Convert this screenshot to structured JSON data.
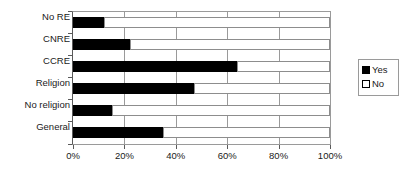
{
  "chart_data": {
    "type": "bar",
    "orientation": "horizontal",
    "stacked": true,
    "percent": true,
    "title": "",
    "subtitle": "",
    "xlabel": "",
    "ylabel": "",
    "categories": [
      "No RE",
      "CNRE",
      "CCRE",
      "Religion",
      "No religion",
      "General"
    ],
    "category_order_top_to_bottom": [
      "No RE",
      "CNRE",
      "CCRE",
      "Religion",
      "No religion",
      "General"
    ],
    "series": [
      {
        "name": "Yes",
        "color": "#000000",
        "values": [
          12,
          22,
          64,
          47,
          15,
          35
        ]
      },
      {
        "name": "No",
        "color": "#ffffff",
        "values": [
          88,
          78,
          36,
          53,
          85,
          65
        ]
      }
    ],
    "xlim": [
      0,
      100
    ],
    "xticks": [
      0,
      20,
      40,
      60,
      80,
      100
    ],
    "xtick_labels": [
      "0%",
      "20%",
      "40%",
      "60%",
      "80%",
      "100%"
    ],
    "grid": true,
    "grid_axis": "x",
    "legend": {
      "position": "right",
      "entries": [
        {
          "label": "Yes",
          "swatch": "black-filled"
        },
        {
          "label": "No",
          "swatch": "white-outline"
        }
      ]
    },
    "annotations": []
  },
  "colors": {
    "yes": "#000000",
    "no": "#ffffff",
    "axis": "#5a5a5a",
    "grid": "#9a9a9a",
    "text": "#1a1a1a",
    "background": "#ffffff"
  }
}
